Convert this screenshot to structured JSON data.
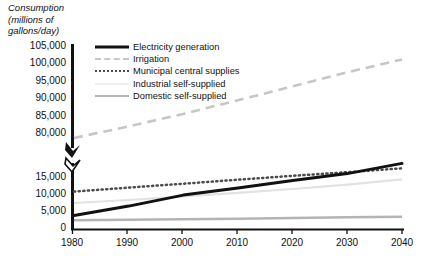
{
  "axis_title": "Consumption (millions of gallons/day)",
  "axis_title_lines": [
    "Consumption",
    "(millions of",
    "gallons/day)"
  ],
  "legend": [
    {
      "label": "Electricity generation",
      "style": "solid-black",
      "color": "#111111"
    },
    {
      "label": "Irrigation",
      "style": "dash-gray",
      "color": "#c6c6c6"
    },
    {
      "label": "Municipal central supplies",
      "style": "dot-dark",
      "color": "#4a4a4a"
    },
    {
      "label": "Industrial self-supplied",
      "style": "solid-light",
      "color": "#e2e2e2"
    },
    {
      "label": "Domestic self-supplied",
      "style": "solid-mid",
      "color": "#b4b4b4"
    }
  ],
  "y_ticks_upper": [
    "105,000",
    "100,000",
    "95,000",
    "90,000",
    "85,000",
    "80,000"
  ],
  "y_ticks_lower": [
    "15,000",
    "10,000",
    "5,000",
    "0"
  ],
  "x_ticks": [
    "1980",
    "1990",
    "2000",
    "2010",
    "2020",
    "2030",
    "2040"
  ],
  "chart_data": {
    "type": "line",
    "title": "",
    "xlabel": "",
    "ylabel": "Consumption (millions of gallons/day)",
    "broken_axis": true,
    "ylim_lower": [
      0,
      15000
    ],
    "ylim_upper": [
      80000,
      105000
    ],
    "y_ticks_lower": [
      0,
      5000,
      10000,
      15000
    ],
    "y_ticks_upper": [
      80000,
      85000,
      90000,
      95000,
      100000,
      105000
    ],
    "xlim": [
      1980,
      2040
    ],
    "grid": false,
    "legend_position": "upper-left-inside",
    "x": [
      1980,
      1990,
      2000,
      2010,
      2020,
      2030,
      2040
    ],
    "series": [
      {
        "name": "Electricity generation",
        "panel": "lower",
        "color": "#111111",
        "style": "solid",
        "values": [
          3100,
          5200,
          7700,
          9300,
          11000,
          12600,
          14900
        ]
      },
      {
        "name": "Irrigation",
        "panel": "upper",
        "color": "#c6c6c6",
        "style": "dashed",
        "values": [
          82400,
          85200,
          88200,
          91500,
          94800,
          98200,
          101300
        ]
      },
      {
        "name": "Municipal central supplies",
        "panel": "lower",
        "color": "#4a4a4a",
        "style": "dotted",
        "values": [
          8500,
          9400,
          10300,
          11200,
          12100,
          12900,
          13800
        ]
      },
      {
        "name": "Industrial self-supplied",
        "panel": "lower",
        "color": "#e2e2e2",
        "style": "solid",
        "values": [
          5900,
          6600,
          7400,
          8200,
          9100,
          10100,
          11300
        ]
      },
      {
        "name": "Domestic self-supplied",
        "panel": "lower",
        "color": "#b4b4b4",
        "style": "solid",
        "values": [
          2000,
          2100,
          2200,
          2350,
          2500,
          2650,
          2800
        ]
      }
    ]
  }
}
